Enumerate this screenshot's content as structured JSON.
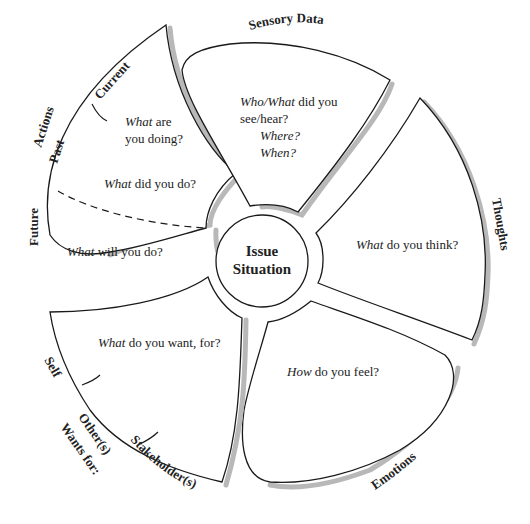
{
  "hub": {
    "line1": "Issue",
    "line2": "Situation"
  },
  "petals": {
    "actions": {
      "label": "Actions",
      "sub_labels": {
        "current": "Current",
        "past": "Past",
        "future": "Future"
      },
      "questions": {
        "current": {
          "italic": "What",
          "rest1": " are",
          "line2": "you doing?"
        },
        "past": {
          "italic": "What",
          "rest": " did you do?"
        },
        "future": {
          "italic": "What",
          "rest": " will you do?"
        }
      }
    },
    "sensory": {
      "label": "Sensory Data",
      "question": {
        "italic1": "Who/What",
        "rest1": " did you",
        "line2": "see/hear?",
        "line3": "Where?",
        "line4": "When?"
      }
    },
    "thoughts": {
      "label": "Thoughts",
      "question": {
        "italic": "What",
        "rest": " do  you think?"
      }
    },
    "emotions": {
      "label": "Emotions",
      "question": {
        "italic": "How",
        "rest": " do  you feel?"
      }
    },
    "wants": {
      "label": "Wants for:",
      "sub_labels": {
        "self": "Self",
        "others": "Other(s)",
        "stakeholders": "Stakeholder(s)"
      },
      "question": {
        "italic": "What",
        "rest": " do you want, for?"
      }
    }
  }
}
